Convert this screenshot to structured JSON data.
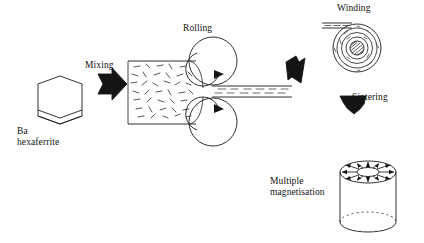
{
  "figure": {
    "background_color": "#ffffff",
    "ink_color": "#1a1a1a"
  },
  "labels": {
    "raw_material_line1": "Ba",
    "raw_material_line2": "hexaferrite",
    "mixing": "Mixing",
    "rolling": "Rolling",
    "winding": "Winding",
    "sintering": "Sintering",
    "magnetisation_line1": "Multiple",
    "magnetisation_line2": "magnetisation"
  },
  "stages": [
    {
      "id": "raw-material",
      "name": "Ba hexaferrite platelet",
      "shape": "hexagonal-platelet",
      "label": "Ba hexaferrite"
    },
    {
      "id": "mixing",
      "name": "Mixing step",
      "shape": "block-arrow-right",
      "label": "Mixing"
    },
    {
      "id": "rolling",
      "name": "Rolling mill with two rollers",
      "shape": "two-rollers-with-rotation-arrows",
      "label": "Rolling",
      "input_texture": "randomly oriented particles",
      "output_texture": "aligned particles"
    },
    {
      "id": "transfer",
      "name": "Transfer to winding",
      "shape": "block-arrow-up-right",
      "label": ""
    },
    {
      "id": "winding",
      "name": "Winding spiral roll with core",
      "shape": "spiral-roll",
      "label": "Winding"
    },
    {
      "id": "sintering",
      "name": "Sintering step",
      "shape": "block-arrow-down",
      "label": "Sintering"
    },
    {
      "id": "magnetisation",
      "name": "Multiple magnetisation cylinder",
      "shape": "cylinder-with-radial-arrows",
      "label": "Multiple magnetisation",
      "arrow_count": 12
    }
  ]
}
